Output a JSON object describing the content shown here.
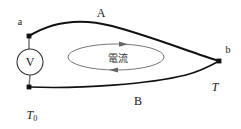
{
  "figure": {
    "type": "thermoelectric-circuit-diagram",
    "background_color": "#ffffff",
    "line_color": "#111111",
    "loop_color": "#555555",
    "labels": {
      "node_a": "a",
      "node_b": "b",
      "conductor_a": "A",
      "conductor_b": "B",
      "temperature_hot": "T",
      "temperature_cold_base": "T",
      "temperature_cold_sub": "0",
      "voltmeter": "V",
      "current_loop": "電流"
    },
    "geometry": {
      "node_a": {
        "x": 29,
        "y": 36
      },
      "node_c": {
        "x": 29,
        "y": 87
      },
      "node_b": {
        "x": 219,
        "y": 61
      },
      "voltmeter_center": {
        "x": 30,
        "y": 62
      },
      "voltmeter_radius": 13,
      "loop_ellipse": {
        "cx": 116,
        "cy": 57,
        "rx": 48,
        "ry": 13
      },
      "arrow_top": {
        "x": 124,
        "y": 44,
        "direction": "right"
      },
      "arrow_bottom": {
        "x": 114,
        "y": 70,
        "direction": "left"
      }
    }
  }
}
